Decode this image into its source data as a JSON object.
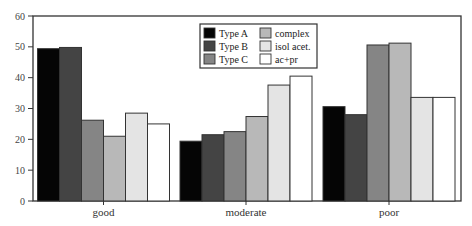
{
  "chart_data": {
    "type": "bar",
    "title": "",
    "xlabel": "",
    "ylabel": "",
    "ylim": [
      0,
      60
    ],
    "yticks": [
      0,
      10,
      20,
      30,
      40,
      50,
      60
    ],
    "grid": false,
    "legend_position": "top-center (inside plot)",
    "categories": [
      "good",
      "moderate",
      "poor"
    ],
    "series": [
      {
        "name": "Type A",
        "color": "#050505",
        "values": [
          49.4,
          19.4,
          30.6
        ]
      },
      {
        "name": "Type B",
        "color": "#444444",
        "values": [
          49.8,
          21.5,
          28.0
        ]
      },
      {
        "name": "Type C",
        "color": "#858585",
        "values": [
          26.2,
          22.5,
          50.6
        ]
      },
      {
        "name": "complex",
        "color": "#b8b8b8",
        "values": [
          21.0,
          27.4,
          51.2
        ]
      },
      {
        "name": "isol acet.",
        "color": "#e4e4e4",
        "values": [
          28.5,
          37.6,
          33.6
        ]
      },
      {
        "name": "ac+pr",
        "color": "#ffffff",
        "values": [
          25.0,
          40.5,
          33.6
        ]
      }
    ]
  }
}
